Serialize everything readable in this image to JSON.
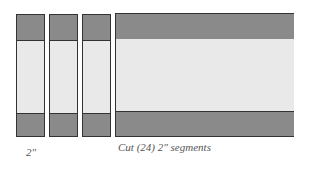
{
  "diagram": {
    "strip_count_shown": 3,
    "strip_label": "2\"",
    "caption": "Cut (24) 2\" segments",
    "colors": {
      "dark_fabric": "#8a8a8a",
      "light_fabric": "#e9e9e9",
      "outline": "#333333"
    }
  }
}
